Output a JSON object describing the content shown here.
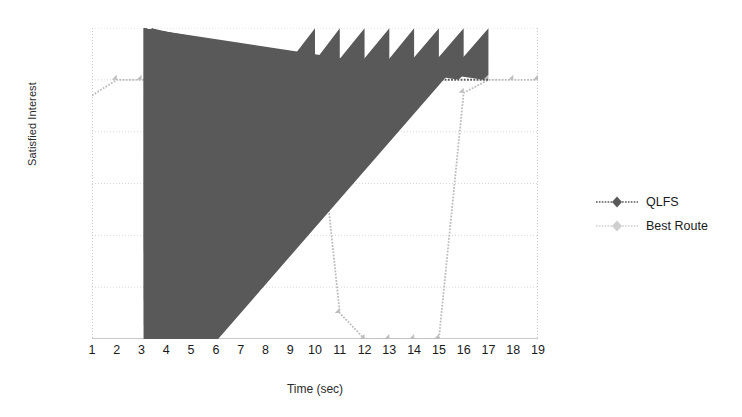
{
  "chart_data": {
    "type": "line",
    "title": "",
    "xlabel": "Time (sec)",
    "ylabel": "Satisfied Interest",
    "x": [
      1,
      2,
      3,
      4,
      5,
      6,
      7,
      8,
      9,
      10,
      11,
      12,
      13,
      14,
      15,
      16,
      17,
      18,
      19
    ],
    "xlim": [
      1,
      19
    ],
    "ylim": [
      0,
      120
    ],
    "yticks": [
      0,
      20,
      40,
      60,
      80,
      100,
      120
    ],
    "xticks": [
      1,
      2,
      3,
      4,
      5,
      6,
      7,
      8,
      9,
      10,
      11,
      12,
      13,
      14,
      15,
      16,
      17,
      18,
      19
    ],
    "grid": "horizontal-dotted",
    "legend_position": "right",
    "series": [
      {
        "name": "QLFS",
        "color": "#595959",
        "marker": "diamond",
        "x": [
          10,
          11,
          12,
          13,
          14,
          15,
          16,
          17
        ],
        "values": [
          100,
          97,
          100,
          100,
          97,
          100,
          100,
          100
        ]
      },
      {
        "name": "Best Route",
        "color": "#bdbdbd",
        "marker": "diamond",
        "x": [
          1,
          2,
          3,
          4,
          5,
          6,
          7,
          8,
          9,
          10,
          11,
          12,
          13,
          14,
          15,
          16,
          17,
          18,
          19
        ],
        "values": [
          94,
          100,
          100,
          100,
          100,
          100,
          100,
          100,
          100,
          100,
          10,
          0,
          0,
          0,
          0,
          95,
          100,
          100,
          100
        ]
      }
    ]
  },
  "axes": {
    "y_tick_labels": [
      "0",
      "20",
      "40",
      "60",
      "80",
      "100",
      "120"
    ],
    "x_tick_labels": [
      "1",
      "2",
      "3",
      "4",
      "5",
      "6",
      "7",
      "8",
      "9",
      "10",
      "11",
      "12",
      "13",
      "14",
      "15",
      "16",
      "17",
      "18",
      "19"
    ],
    "y_axis_title": "Satisfied Interest",
    "x_axis_title": "Time (sec)"
  },
  "legend": {
    "items": [
      {
        "label": "QLFS",
        "color": "#595959"
      },
      {
        "label": "Best Route",
        "color": "#bdbdbd"
      }
    ]
  },
  "colors": {
    "qlfs": "#595959",
    "best_route": "#bdbdbd",
    "grid": "#d8d8d8",
    "axis": "#c9c9c9",
    "text": "#1a1a1a",
    "background": "#ffffff"
  }
}
